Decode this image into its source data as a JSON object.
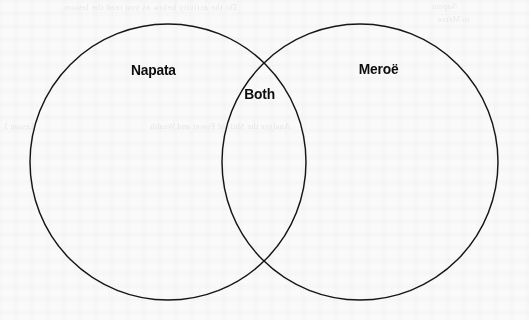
{
  "page": {
    "background_color": "#fafafa",
    "ink_color": "#16161a"
  },
  "diagram": {
    "type": "venn",
    "set_count": 2,
    "stroke_color": "#16161a",
    "stroke_width": 1.45,
    "left_circle": {
      "cx": 168,
      "cy": 162,
      "r": 138
    },
    "right_circle": {
      "cx": 360,
      "cy": 162,
      "r": 138
    },
    "labels": {
      "left": "Napata",
      "overlap": "Both",
      "right": "Meroë"
    }
  },
  "ghost_text": {
    "header_line": "Do the activity below as you read the lesson.",
    "header_right": "Napata",
    "header_right_2": "to Meroe",
    "mid_left": "Lesson 3",
    "mid_line": "Analyze the Shift of Power and Wealth"
  }
}
